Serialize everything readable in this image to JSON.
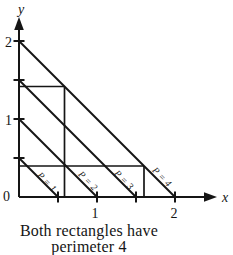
{
  "colors": {
    "ink": "#151515",
    "background": "#ffffff"
  },
  "figure": {
    "x_axis_label": "x",
    "y_axis_label": "y",
    "origin_label": "0",
    "x_tick_values": [
      0.5,
      1,
      1.5,
      2
    ],
    "y_tick_values": [
      0.5,
      1,
      1.5,
      2
    ],
    "x_tick_labels_shown": [
      "1",
      "2"
    ],
    "y_tick_labels_shown": [
      "1",
      "2"
    ],
    "iso_perimeter_lines": [
      {
        "label": "P = 1",
        "x_intercept": 0.5,
        "y_intercept": 0.5
      },
      {
        "label": "P = 2",
        "x_intercept": 1,
        "y_intercept": 1
      },
      {
        "label": "P = 3",
        "x_intercept": 1.5,
        "y_intercept": 1.5
      },
      {
        "label": "P = 4",
        "x_intercept": 2,
        "y_intercept": 2
      }
    ],
    "rectangles": [
      {
        "name": "tall-rectangle",
        "width_units": 0.5,
        "height_units": 1.5
      },
      {
        "name": "wide-rectangle",
        "width_units": 1.5,
        "height_units": 0.5
      }
    ]
  },
  "caption": {
    "line1": "Both rectangles have",
    "line2": "perimeter 4"
  },
  "svg": {
    "width": 233,
    "height": 223,
    "lines": [
      {
        "name": "y-axis",
        "x1": 19,
        "y1": 197,
        "x2": 19,
        "y2": 26,
        "w": 2
      },
      {
        "name": "x-axis",
        "x1": 19,
        "y1": 197,
        "x2": 206,
        "y2": 197,
        "w": 2
      },
      {
        "name": "y-tick-2",
        "x1": 13.5,
        "y1": 41,
        "x2": 24.5,
        "y2": 41,
        "w": 2
      },
      {
        "name": "y-tick-1-5",
        "x1": 13.5,
        "y1": 80,
        "x2": 24.5,
        "y2": 80,
        "w": 2
      },
      {
        "name": "y-tick-1",
        "x1": 13.5,
        "y1": 119,
        "x2": 24.5,
        "y2": 119,
        "w": 2
      },
      {
        "name": "y-tick-0-5",
        "x1": 13.5,
        "y1": 158,
        "x2": 24.5,
        "y2": 158,
        "w": 2
      },
      {
        "name": "x-tick-0-5",
        "x1": 58,
        "y1": 191.5,
        "x2": 58,
        "y2": 202.5,
        "w": 2
      },
      {
        "name": "x-tick-1",
        "x1": 97,
        "y1": 191.5,
        "x2": 97,
        "y2": 202.5,
        "w": 2
      },
      {
        "name": "x-tick-1-5",
        "x1": 136,
        "y1": 191.5,
        "x2": 136,
        "y2": 202.5,
        "w": 2
      },
      {
        "name": "x-tick-2",
        "x1": 175,
        "y1": 191.5,
        "x2": 175,
        "y2": 202.5,
        "w": 2
      },
      {
        "name": "iso-line-p1",
        "x1": 19,
        "y1": 158,
        "x2": 58,
        "y2": 197,
        "w": 2
      },
      {
        "name": "iso-line-p2",
        "x1": 19,
        "y1": 119,
        "x2": 97,
        "y2": 197,
        "w": 2
      },
      {
        "name": "iso-line-p3",
        "x1": 19,
        "y1": 80,
        "x2": 136,
        "y2": 197,
        "w": 2
      },
      {
        "name": "iso-line-p4",
        "x1": 19,
        "y1": 41,
        "x2": 175,
        "y2": 197,
        "w": 2
      },
      {
        "name": "tall-rectangle-top",
        "x1": 19,
        "y1": 86.5,
        "x2": 64.5,
        "y2": 86.5,
        "w": 1.7
      },
      {
        "name": "tall-rectangle-right",
        "x1": 64.5,
        "y1": 86.5,
        "x2": 64.5,
        "y2": 197,
        "w": 1.7
      },
      {
        "name": "wide-rectangle-top",
        "x1": 19,
        "y1": 166,
        "x2": 144,
        "y2": 166,
        "w": 1.7
      },
      {
        "name": "wide-rectangle-right",
        "x1": 144,
        "y1": 166,
        "x2": 144,
        "y2": 197,
        "w": 1.7
      }
    ],
    "polygons": [
      {
        "name": "y-axis-arrowhead",
        "points": "19,17 14.2,30 23.8,30"
      },
      {
        "name": "x-axis-arrowhead",
        "points": "217,197 204,192.2 204,201.8"
      }
    ],
    "texts": [
      {
        "name": "y-axis-label",
        "text": "y",
        "x": 21,
        "y": 14,
        "size": 14,
        "anchor": "middle",
        "italic": true
      },
      {
        "name": "x-axis-label",
        "text": "x",
        "x": 222,
        "y": 202,
        "size": 14,
        "anchor": "start",
        "italic": true
      },
      {
        "name": "y-tick-label-2",
        "text": "2",
        "x": 12,
        "y": 47,
        "size": 14,
        "anchor": "end"
      },
      {
        "name": "y-tick-label-1",
        "text": "1",
        "x": 12,
        "y": 125,
        "size": 14,
        "anchor": "end"
      },
      {
        "name": "origin-label",
        "text": "0",
        "x": 10,
        "y": 201,
        "size": 14,
        "anchor": "end"
      },
      {
        "name": "x-tick-label-1",
        "text": "1",
        "x": 95,
        "y": 218,
        "size": 14,
        "anchor": "middle"
      },
      {
        "name": "x-tick-label-2",
        "text": "2",
        "x": 174,
        "y": 218,
        "size": 14,
        "anchor": "middle"
      },
      {
        "name": "iso-line-label-p1",
        "text": "P = 1",
        "x": 47,
        "y": 182,
        "size": 9.5,
        "anchor": "middle",
        "italic": true,
        "rotate": 46
      },
      {
        "name": "iso-line-label-p2",
        "text": "P = 2",
        "x": 88,
        "y": 181,
        "size": 9.5,
        "anchor": "middle",
        "italic": true,
        "rotate": 46
      },
      {
        "name": "iso-line-label-p3",
        "text": "P = 3",
        "x": 124,
        "y": 180,
        "size": 9.5,
        "anchor": "middle",
        "italic": true,
        "rotate": 46
      },
      {
        "name": "iso-line-label-p4",
        "text": "P = 4",
        "x": 162,
        "y": 177,
        "size": 9.5,
        "anchor": "middle",
        "italic": true,
        "rotate": 46
      }
    ]
  }
}
